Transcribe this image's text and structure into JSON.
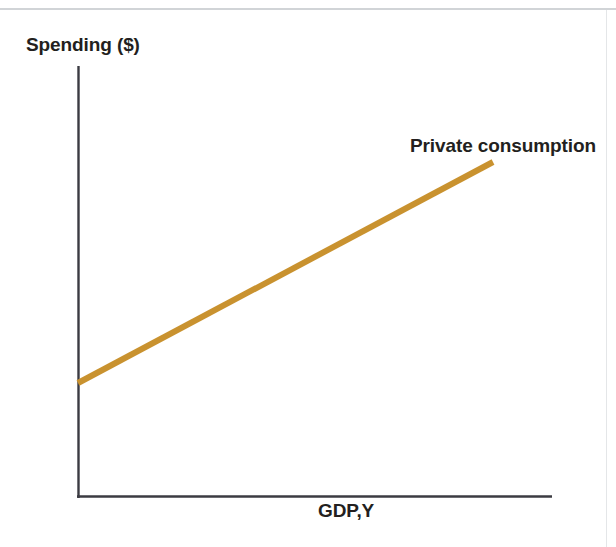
{
  "page": {
    "background_color": "#ffffff",
    "top_rule_color": "#c9ccd0"
  },
  "chart_data": {
    "type": "line",
    "title": "",
    "xlabel": "GDP,Y",
    "ylabel": "Spending ($)",
    "grid": false,
    "legend_position": "inline-right-end",
    "axis_color": "#3b3b42",
    "series": [
      {
        "name": "Private consumption",
        "color": "#c9922f",
        "line_width": 6,
        "annotation": "Private consumption",
        "x": [
          0,
          100
        ],
        "y": [
          24,
          72
        ],
        "points_px": [
          {
            "x": 78,
            "y": 383
          },
          {
            "x": 493,
            "y": 162
          }
        ]
      }
    ],
    "xlim": [
      0,
      100
    ],
    "ylim": [
      0,
      100
    ],
    "x_ticks": [],
    "y_ticks": []
  },
  "axes": {
    "y_axis_label": "Spending ($)",
    "x_axis_label": "GDP,Y",
    "origin_px": {
      "x": 78,
      "y": 497
    },
    "y_axis_top_px": 66,
    "x_axis_right_px": 552
  },
  "annotations": {
    "series_label": "Private consumption"
  }
}
